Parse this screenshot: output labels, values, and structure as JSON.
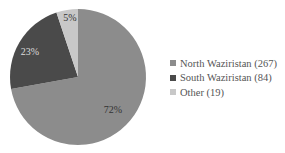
{
  "chart_data": {
    "type": "pie",
    "title": "",
    "categories": [
      "North Waziristan",
      "South Waziristan",
      "Other"
    ],
    "values": [
      267,
      84,
      19
    ],
    "percent_labels": [
      "72%",
      "23%",
      "5%"
    ],
    "colors": [
      "#8c8c8c",
      "#4a4a4a",
      "#c8c8c8"
    ],
    "legend": {
      "position": "right",
      "entries": [
        "North Waziristan (267)",
        "South Waziristan (84)",
        "Other (19)"
      ]
    },
    "start_angle_deg": 0,
    "direction": "clockwise"
  },
  "legend": {
    "items": [
      {
        "label": "North Waziristan (267)",
        "color": "#8c8c8c"
      },
      {
        "label": "South Waziristan (84)",
        "color": "#4a4a4a"
      },
      {
        "label": "Other (19)",
        "color": "#c8c8c8"
      }
    ]
  },
  "slice_labels": {
    "north": "72%",
    "south": "23%",
    "other": "5%"
  }
}
